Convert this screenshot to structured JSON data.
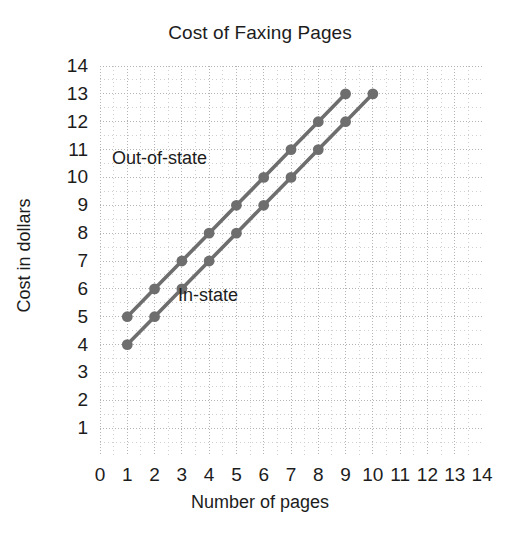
{
  "chart_data": {
    "type": "line",
    "title": "Cost of Faxing Pages",
    "xlabel": "Number of pages",
    "ylabel": "Cost in dollars",
    "xlim": [
      0,
      14
    ],
    "ylim": [
      0,
      14
    ],
    "grid": true,
    "grid_style": "dotted",
    "legend": "inline-annotations",
    "line_color": "#6e6e6e",
    "marker_color": "#6e6e6e",
    "marker": "circle",
    "x_ticks": [
      0,
      1,
      2,
      3,
      4,
      5,
      6,
      7,
      8,
      9,
      10,
      11,
      12,
      13,
      14
    ],
    "y_ticks": [
      1,
      2,
      3,
      4,
      5,
      6,
      7,
      8,
      9,
      10,
      11,
      12,
      13,
      14
    ],
    "series": [
      {
        "name": "Out-of-state",
        "x": [
          1,
          2,
          3,
          4,
          5,
          6,
          7,
          8,
          9
        ],
        "values": [
          5,
          6,
          7,
          8,
          9,
          10,
          11,
          12,
          13
        ]
      },
      {
        "name": "In-state",
        "x": [
          1,
          2,
          3,
          4,
          5,
          6,
          7,
          8,
          9,
          10
        ],
        "values": [
          4,
          5,
          6,
          7,
          8,
          9,
          10,
          11,
          12,
          13
        ]
      }
    ],
    "annotations": [
      {
        "text": "Out-of-state",
        "x": 1.6,
        "y": 10.7
      },
      {
        "text": "In-state",
        "x": 4.3,
        "y": 5.9
      }
    ]
  }
}
